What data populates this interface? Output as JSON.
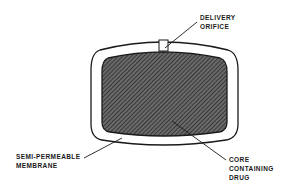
{
  "diagram": {
    "labels": {
      "orifice": [
        "DELIVERY",
        "ORIFICE"
      ],
      "membrane": [
        "SEMI-PERMEABLE",
        "MEMBRANE"
      ],
      "core": [
        "CORE",
        "CONTAINING",
        "DRUG"
      ]
    },
    "colors": {
      "line": "#1a1a1a",
      "core_fill": "#555555",
      "background": "#ffffff"
    }
  }
}
